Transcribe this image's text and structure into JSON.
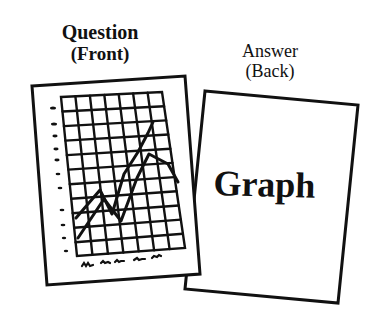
{
  "question_card": {
    "title_line1": "Question",
    "title_line2": "(Front)",
    "content": "hand-drawn line graph on grid",
    "grid_columns": 7,
    "grid_rows": 11
  },
  "answer_card": {
    "title_line1": "Answer",
    "title_line2": "(Back)",
    "content_text": "Graph"
  },
  "colors": {
    "ink": "#111111",
    "background": "#ffffff"
  }
}
